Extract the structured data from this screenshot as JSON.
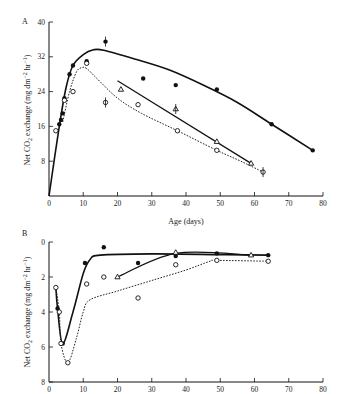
{
  "chart_data": [
    {
      "panel": "A",
      "type": "line",
      "title": "",
      "xlabel": "Age (days)",
      "ylabel": "Net CO2 exchange (mg dm^-2 hr^-1)",
      "xlim": [
        0,
        80
      ],
      "ylim": [
        0,
        40
      ],
      "x_ticks": [
        0,
        10,
        20,
        30,
        40,
        50,
        60,
        70,
        80
      ],
      "y_ticks": [
        40,
        32,
        24,
        16,
        8
      ],
      "grid": false,
      "series": [
        {
          "name": "filled circles (solid curve)",
          "marker": "filled-circle",
          "line": "solid",
          "points": [
            [
              3,
              16.5
            ],
            [
              3.5,
              17.5
            ],
            [
              4,
              19
            ],
            [
              4.5,
              22.5
            ],
            [
              6,
              28
            ],
            [
              7,
              30
            ],
            [
              11,
              31
            ],
            [
              16.5,
              35.5
            ],
            [
              27.5,
              27
            ],
            [
              37,
              25.5
            ],
            [
              49,
              24.5
            ],
            [
              65,
              16.5
            ],
            [
              77,
              10.5
            ]
          ],
          "curve": [
            [
              0,
              0
            ],
            [
              3,
              16
            ],
            [
              5,
              25
            ],
            [
              7,
              30
            ],
            [
              10,
              32.5
            ],
            [
              13,
              33.6
            ],
            [
              16,
              33.5
            ],
            [
              25,
              31.5
            ],
            [
              35,
              29
            ],
            [
              45,
              25.5
            ],
            [
              55,
              21.5
            ],
            [
              65,
              16.5
            ],
            [
              77,
              10.5
            ]
          ]
        },
        {
          "name": "open circles (dotted curve)",
          "marker": "open-circle",
          "line": "dotted",
          "points": [
            [
              2,
              15
            ],
            [
              4.5,
              22
            ],
            [
              7,
              24
            ],
            [
              11,
              30.5
            ],
            [
              16.5,
              21.5
            ],
            [
              26,
              21
            ],
            [
              37.5,
              15
            ],
            [
              49,
              10.5
            ],
            [
              62.5,
              5.5
            ]
          ],
          "curve": [
            [
              4,
              17
            ],
            [
              6,
              24
            ],
            [
              8,
              28.5
            ],
            [
              9.5,
              29.5
            ],
            [
              11,
              29.3
            ],
            [
              14,
              27
            ],
            [
              20,
              22.5
            ],
            [
              27,
              19
            ],
            [
              37.5,
              15
            ],
            [
              49,
              10.5
            ],
            [
              56,
              8
            ],
            [
              62.5,
              5.5
            ]
          ]
        },
        {
          "name": "triangles (straight line)",
          "marker": "open-triangle",
          "line": "solid",
          "points": [
            [
              21,
              24.5
            ],
            [
              37,
              20
            ],
            [
              49,
              12.5
            ],
            [
              59,
              7.5
            ]
          ],
          "curve": [
            [
              20,
              26.5
            ],
            [
              59,
              7.5
            ]
          ]
        }
      ]
    },
    {
      "panel": "B",
      "type": "line",
      "title": "",
      "xlabel": "",
      "ylabel": "Net CO2 exchange (mg dm^-2 hr^-1)",
      "xlim": [
        0,
        80
      ],
      "ylim": [
        8,
        0
      ],
      "y_inverted": true,
      "x_ticks": [
        0,
        10,
        20,
        30,
        40,
        50,
        60,
        70,
        80
      ],
      "y_ticks": [
        0,
        2,
        4,
        6,
        8
      ],
      "grid": false,
      "series": [
        {
          "name": "filled circles (solid curve)",
          "marker": "filled-circle",
          "line": "solid",
          "points": [
            [
              2.5,
              3.8
            ],
            [
              4,
              5.8
            ],
            [
              10.5,
              1.2
            ],
            [
              16,
              0.3
            ],
            [
              26,
              1.2
            ],
            [
              37,
              0.8
            ],
            [
              49,
              0.65
            ],
            [
              64,
              0.75
            ]
          ],
          "curve": [
            [
              2,
              2.6
            ],
            [
              2.5,
              3.8
            ],
            [
              4,
              5.8
            ],
            [
              7,
              4
            ],
            [
              10,
              1.8
            ],
            [
              12,
              1
            ],
            [
              15,
              0.75
            ],
            [
              30,
              0.68
            ],
            [
              50,
              0.72
            ],
            [
              64,
              0.75
            ]
          ]
        },
        {
          "name": "open circles (dotted curve)",
          "marker": "open-circle",
          "line": "dotted",
          "points": [
            [
              2,
              2.6
            ],
            [
              3,
              4
            ],
            [
              3.5,
              5.8
            ],
            [
              5.5,
              6.9
            ],
            [
              11,
              2.4
            ],
            [
              16,
              2
            ],
            [
              26,
              3.2
            ],
            [
              37,
              1.3
            ],
            [
              49,
              1.05
            ],
            [
              64,
              1.1
            ]
          ],
          "curve": [
            [
              2,
              2.6
            ],
            [
              3,
              4
            ],
            [
              3.5,
              5.8
            ],
            [
              5.5,
              6.9
            ],
            [
              8,
              5.5
            ],
            [
              10,
              4
            ],
            [
              12,
              3.3
            ],
            [
              20,
              2.8
            ],
            [
              30,
              2.2
            ],
            [
              40,
              1.6
            ],
            [
              47,
              1.1
            ],
            [
              49,
              1.05
            ],
            [
              64,
              1.1
            ]
          ]
        },
        {
          "name": "triangles (straight line)",
          "marker": "open-triangle",
          "line": "solid",
          "points": [
            [
              20,
              2
            ],
            [
              37,
              0.6
            ],
            [
              59,
              0.75
            ]
          ],
          "curve": [
            [
              20,
              2
            ],
            [
              37,
              0.65
            ],
            [
              59,
              0.75
            ]
          ]
        }
      ]
    }
  ],
  "labels": {
    "panel_a": "A",
    "panel_b": "B",
    "xlabel": "Age (days)",
    "ylabel_prefix": "Net CO",
    "ylabel_sub": "2",
    "ylabel_mid": " exchange (mg dm",
    "ylabel_sup1": "−2",
    "ylabel_hr": " hr",
    "ylabel_sup2": "−1",
    "ylabel_end": ")"
  }
}
